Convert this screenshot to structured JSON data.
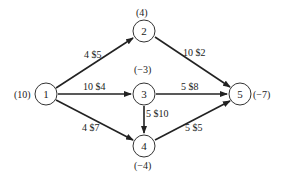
{
  "diagram": {
    "type": "network-flow",
    "nodes": [
      {
        "id": "1",
        "label": "1",
        "supply": "(10)"
      },
      {
        "id": "2",
        "label": "2",
        "supply": "(4)"
      },
      {
        "id": "3",
        "label": "3",
        "supply": "(−3)"
      },
      {
        "id": "4",
        "label": "4",
        "supply": "(−4)"
      },
      {
        "id": "5",
        "label": "5",
        "supply": "(−7)"
      }
    ],
    "edges": [
      {
        "from": "1",
        "to": "2",
        "label": "4 $5"
      },
      {
        "from": "1",
        "to": "3",
        "label": "10 $4"
      },
      {
        "from": "1",
        "to": "4",
        "label": "4 $7"
      },
      {
        "from": "2",
        "to": "5",
        "label": "10 $2"
      },
      {
        "from": "3",
        "to": "5",
        "label": "5 $8"
      },
      {
        "from": "3",
        "to": "4",
        "label": "5 $10"
      },
      {
        "from": "4",
        "to": "5",
        "label": "5 $5"
      }
    ]
  }
}
